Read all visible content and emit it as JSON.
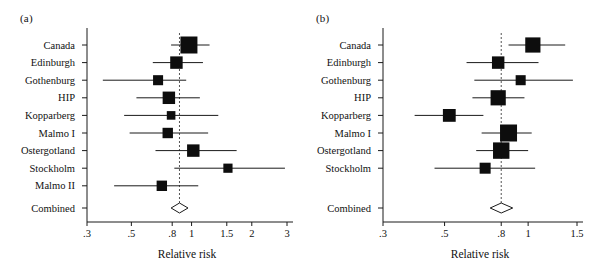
{
  "figure": {
    "panels": [
      {
        "id": "a",
        "label": "(a)",
        "axis_title": "Relative risk",
        "combined_label": "Combined"
      },
      {
        "id": "b",
        "label": "(b)",
        "axis_title": "Relative risk",
        "combined_label": "Combined"
      }
    ]
  },
  "chart_data": [
    {
      "type": "forest",
      "panel": "a",
      "title": "(a)",
      "xlabel": "Relative risk",
      "ylabel": "",
      "scale": "log",
      "xlim": [
        0.3,
        3
      ],
      "grid": false,
      "null_line": 0.87,
      "tick_labels": [
        ".3",
        ".5",
        ".8",
        "1",
        "1.5",
        "2",
        "3"
      ],
      "tick_values": [
        0.3,
        0.5,
        0.8,
        1,
        1.5,
        2,
        3
      ],
      "categories": [
        "Canada",
        "Edinburgh",
        "Gothenburg",
        "HIP",
        "Kopparberg",
        "Malmo I",
        "Ostergotland",
        "Stockholm",
        "Malmo II"
      ],
      "values": [
        0.97,
        0.84,
        0.68,
        0.77,
        0.79,
        0.76,
        1.02,
        1.52,
        0.71
      ],
      "ci_low": [
        0.79,
        0.64,
        0.36,
        0.53,
        0.46,
        0.49,
        0.66,
        0.82,
        0.41
      ],
      "ci_high": [
        1.23,
        1.14,
        0.94,
        1.1,
        1.36,
        1.21,
        1.68,
        2.93,
        1.08
      ],
      "weights": [
        1.0,
        0.62,
        0.42,
        0.62,
        0.3,
        0.45,
        0.62,
        0.35,
        0.45
      ],
      "combined": {
        "label": "Combined",
        "value": 0.87,
        "ci_low": 0.79,
        "ci_high": 0.96
      }
    },
    {
      "type": "forest",
      "panel": "b",
      "title": "(b)",
      "xlabel": "Relative risk",
      "ylabel": "",
      "scale": "log",
      "xlim": [
        0.3,
        1.5
      ],
      "grid": false,
      "null_line": 0.8,
      "tick_labels": [
        ".3",
        ".5",
        ".8",
        "1",
        "1.5"
      ],
      "tick_values": [
        0.3,
        0.5,
        0.8,
        1,
        1.5
      ],
      "categories": [
        "Canada",
        "Edinburgh",
        "Gothenburg",
        "HIP",
        "Kopparberg",
        "Malmo I",
        "Ostergotland",
        "Stockholm"
      ],
      "values": [
        1.04,
        0.78,
        0.94,
        0.78,
        0.52,
        0.85,
        0.8,
        0.7
      ],
      "ci_low": [
        0.85,
        0.6,
        0.64,
        0.63,
        0.39,
        0.68,
        0.65,
        0.46
      ],
      "ci_high": [
        1.36,
        1.09,
        1.45,
        0.97,
        0.69,
        1.03,
        1.0,
        1.06
      ],
      "weights": [
        0.85,
        0.62,
        0.42,
        0.85,
        0.65,
        1.0,
        0.95,
        0.5
      ],
      "combined": {
        "label": "Combined",
        "value": 0.8,
        "ci_low": 0.73,
        "ci_high": 0.88
      }
    }
  ],
  "colors": {
    "marker": "#0d0d0d",
    "axis": "#1a1a1a",
    "null_line": "#555555",
    "background": "#ffffff",
    "diamond_fill": "#ffffff"
  }
}
